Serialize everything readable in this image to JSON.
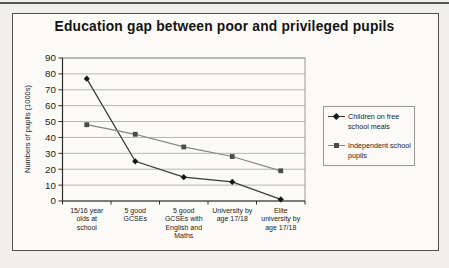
{
  "chart": {
    "title": "Education gap between poor and privileged pupils",
    "ylabel": "Numbers of pupils (1000s)"
  },
  "chart_data": {
    "type": "line",
    "title": "Education gap between poor and privileged pupils",
    "xlabel": "",
    "ylabel": "Numbers of pupils (1000s)",
    "categories": [
      "15/16 year olds at school",
      "5 good GCSEs",
      "5 good GCSEs with English and Maths",
      "University by age 17/18",
      "Elite university by age 17/18"
    ],
    "category_label_lines": [
      [
        "15/16 year",
        "olds at",
        "school"
      ],
      [
        "5 good",
        "GCSEs"
      ],
      [
        "5 good",
        "GCSEs with",
        "English and",
        "Maths"
      ],
      [
        "University by",
        "age 17/18"
      ],
      [
        "Elite",
        "university by",
        "age 17/18"
      ]
    ],
    "series": [
      {
        "name": "Children on free school meals",
        "values": [
          77,
          25,
          15,
          12,
          1
        ],
        "marker": "diamond",
        "color": "#3a3a3a",
        "marker_color": "#161616"
      },
      {
        "name": "Independent school pupils",
        "values": [
          48,
          42,
          34,
          28,
          19
        ],
        "marker": "square",
        "color": "#858585",
        "marker_color": "#4a4a4a"
      }
    ],
    "ylim": [
      0,
      90
    ],
    "yticks": [
      0,
      10,
      20,
      30,
      40,
      50,
      60,
      70,
      80,
      90
    ],
    "grid": true,
    "legend_position": "right",
    "colors": {
      "gridline": "#b6b6b6",
      "axis": "#2f2f2f",
      "plot_border": "#9a9a9a",
      "text": "#1b1b1b"
    }
  }
}
